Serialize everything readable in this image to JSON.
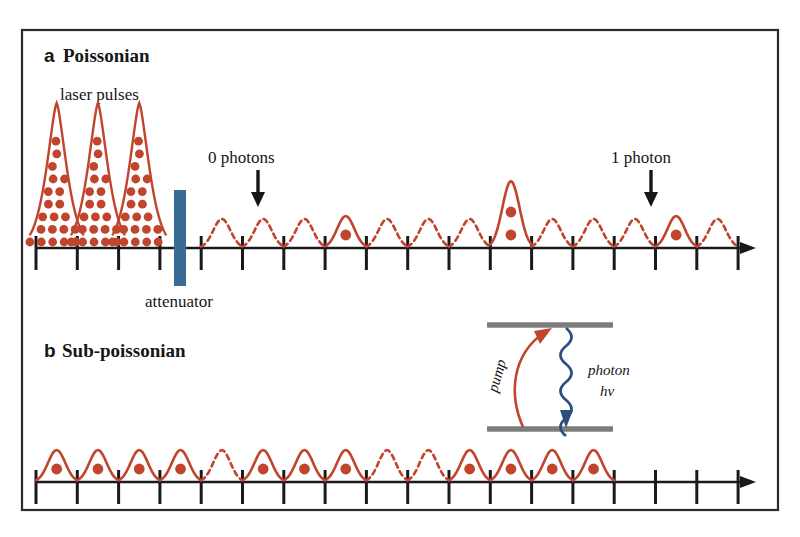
{
  "figure": {
    "border_color": "#2b2b2b",
    "background": "#ffffff",
    "pulse_color": "#c0452c",
    "dot_color": "#c0452c",
    "attenuator_color": "#3a6a96",
    "axis_color": "#1a1a1a",
    "level_color": "#808080",
    "photon_arrow_color": "#2c4f82",
    "pump_arrow_color": "#c0452c"
  },
  "panel_a": {
    "letter": "a",
    "title": "Poissonian",
    "laser_pulses_label": "laser pulses",
    "attenuator_label": "attenuator",
    "zero_photons_label": "0 photons",
    "one_photon_label": "1 photon"
  },
  "panel_b": {
    "letter": "b",
    "title": "Sub-poissonian"
  },
  "inset": {
    "pump_label": "pump",
    "photon_label": "photon",
    "energy_label": "hv"
  },
  "chart_data": {
    "type": "line",
    "xlabel": "",
    "ylabel": "",
    "panels": [
      {
        "id": "a",
        "label": "Poissonian",
        "annotations": [
          {
            "text": "laser pulses",
            "points_to": "tall-input-pulses"
          },
          {
            "text": "attenuator",
            "points_to": "blue-bar"
          },
          {
            "text": "0 photons",
            "points_to": "pulse-index-2"
          },
          {
            "text": "1 photon",
            "points_to": "pulse-index-12"
          }
        ],
        "input_pulses": [
          {
            "index": 0,
            "height": 1.0,
            "photons": 20,
            "style": "solid-filled"
          },
          {
            "index": 1,
            "height": 1.0,
            "photons": 20,
            "style": "solid-filled"
          },
          {
            "index": 2,
            "height": 1.0,
            "photons": 20,
            "style": "solid-filled"
          }
        ],
        "output_pulses": [
          {
            "index": 0,
            "photons": 0,
            "style": "dashed",
            "height": 0.2
          },
          {
            "index": 1,
            "photons": 0,
            "style": "dashed",
            "height": 0.2
          },
          {
            "index": 2,
            "photons": 0,
            "style": "dashed",
            "height": 0.2
          },
          {
            "index": 3,
            "photons": 1,
            "style": "solid",
            "height": 0.22
          },
          {
            "index": 4,
            "photons": 0,
            "style": "dashed",
            "height": 0.2
          },
          {
            "index": 5,
            "photons": 0,
            "style": "dashed",
            "height": 0.2
          },
          {
            "index": 6,
            "photons": 0,
            "style": "dashed",
            "height": 0.2
          },
          {
            "index": 7,
            "photons": 2,
            "style": "solid",
            "height": 0.46
          },
          {
            "index": 8,
            "photons": 0,
            "style": "dashed",
            "height": 0.2
          },
          {
            "index": 9,
            "photons": 0,
            "style": "dashed",
            "height": 0.2
          },
          {
            "index": 10,
            "photons": 0,
            "style": "dashed",
            "height": 0.2
          },
          {
            "index": 11,
            "photons": 1,
            "style": "solid",
            "height": 0.22
          },
          {
            "index": 12,
            "photons": 0,
            "style": "dashed",
            "height": 0.2
          }
        ]
      },
      {
        "id": "b",
        "label": "Sub-poissonian",
        "annotations": [],
        "output_pulses": [
          {
            "index": 0,
            "photons": 1,
            "style": "solid",
            "height": 0.22
          },
          {
            "index": 1,
            "photons": 1,
            "style": "solid",
            "height": 0.22
          },
          {
            "index": 2,
            "photons": 1,
            "style": "solid",
            "height": 0.22
          },
          {
            "index": 3,
            "photons": 1,
            "style": "solid",
            "height": 0.22
          },
          {
            "index": 4,
            "photons": 0,
            "style": "dashed",
            "height": 0.22
          },
          {
            "index": 5,
            "photons": 1,
            "style": "solid",
            "height": 0.22
          },
          {
            "index": 6,
            "photons": 1,
            "style": "solid",
            "height": 0.22
          },
          {
            "index": 7,
            "photons": 1,
            "style": "solid",
            "height": 0.22
          },
          {
            "index": 8,
            "photons": 0,
            "style": "dashed",
            "height": 0.22
          },
          {
            "index": 9,
            "photons": 0,
            "style": "dashed",
            "height": 0.22
          },
          {
            "index": 10,
            "photons": 1,
            "style": "solid",
            "height": 0.22
          },
          {
            "index": 11,
            "photons": 1,
            "style": "solid",
            "height": 0.22
          },
          {
            "index": 12,
            "photons": 1,
            "style": "solid",
            "height": 0.22
          },
          {
            "index": 13,
            "photons": 1,
            "style": "solid",
            "height": 0.22
          }
        ]
      }
    ]
  }
}
